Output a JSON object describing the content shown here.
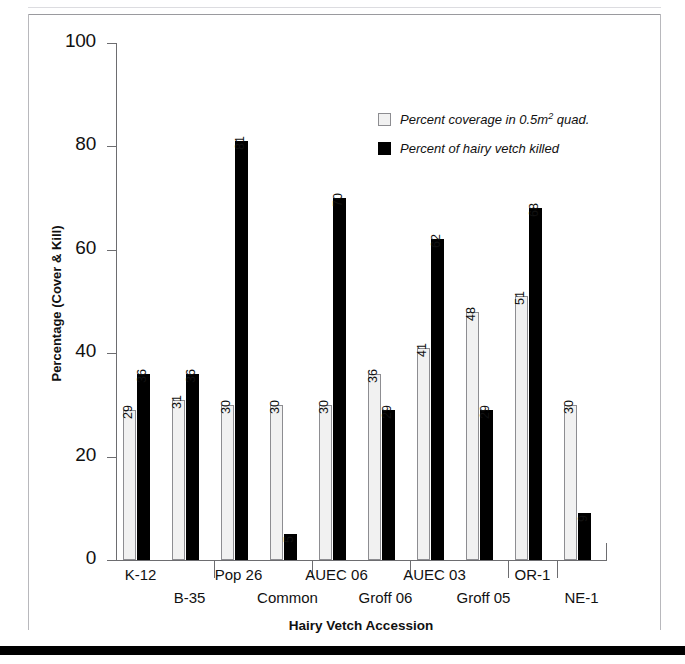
{
  "chart_data": {
    "type": "bar",
    "title": "",
    "xlabel": "Hairy Vetch Accession",
    "ylabel": "Percentage (Cover & Kill)",
    "ylim": [
      0,
      100
    ],
    "yticks": [
      0,
      20,
      40,
      60,
      80,
      100
    ],
    "grid": false,
    "legend_position": "upper-right-inside",
    "categories": [
      "K-12",
      "B-35",
      "Pop 26",
      "Common",
      "AUEC 06",
      "Groff 06",
      "AUEC 03",
      "Groff 05",
      "OR-1",
      "NE-1"
    ],
    "series": [
      {
        "name": "Percent coverage in 0.5m2 quad.",
        "name_prefix": "Percent coverage in 0.5m",
        "name_sup": "2",
        "name_suffix": " quad.",
        "color": "#f1f1f1",
        "values": [
          29,
          31,
          30,
          30,
          30,
          36,
          41,
          48,
          51,
          30
        ]
      },
      {
        "name": "Percent of hairy vetch killed",
        "color": "#000000",
        "values": [
          36,
          36,
          81,
          5,
          70,
          29,
          62,
          29,
          68,
          9
        ]
      }
    ]
  },
  "axis": {
    "y_tick_labels": [
      "100",
      "80",
      "60",
      "40",
      "20",
      "0"
    ]
  },
  "colors": {
    "cover_bar": "#f1f1f1",
    "kill_bar": "#000000",
    "axis": "#6d6d70",
    "frame": "#b8b8bc"
  }
}
